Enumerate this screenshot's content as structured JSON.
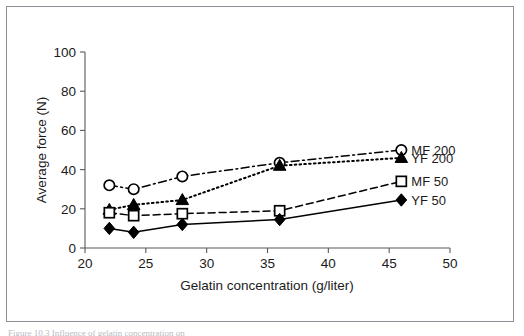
{
  "figure": {
    "caption_partial": "Figure 10.3  Influence of gelatin concentration on"
  },
  "chart_data": {
    "type": "line",
    "title": "",
    "xlabel": "Gelatin concentration (g/liter)",
    "ylabel": "Average force (N)",
    "xlim": [
      20,
      50
    ],
    "ylim": [
      0,
      100
    ],
    "xticks": [
      20,
      25,
      30,
      35,
      40,
      45,
      50
    ],
    "yticks": [
      0,
      20,
      40,
      60,
      80,
      100
    ],
    "xtick_labels": [
      "20",
      "25",
      "30",
      "35",
      "40",
      "45",
      "50"
    ],
    "ytick_labels": [
      "0",
      "20",
      "40",
      "60",
      "80",
      "100"
    ],
    "grid": false,
    "legend_position": "right-inline",
    "x": [
      22,
      24,
      28,
      36,
      46
    ],
    "series": [
      {
        "name": "MF 200",
        "values": [
          32,
          30,
          36.5,
          43.5,
          50
        ],
        "marker": "open-circle",
        "line_style": "dash-dot",
        "color": "#000000"
      },
      {
        "name": "YF 200",
        "values": [
          19.5,
          22,
          24.5,
          42,
          46
        ],
        "marker": "filled-triangle",
        "line_style": "dotted",
        "color": "#000000"
      },
      {
        "name": "MF 50",
        "values": [
          18,
          16.5,
          17.5,
          19,
          34
        ],
        "marker": "open-square",
        "line_style": "dashed",
        "color": "#000000"
      },
      {
        "name": "YF 50",
        "values": [
          10,
          8,
          12,
          14.5,
          24.5
        ],
        "marker": "filled-diamond",
        "line_style": "solid",
        "color": "#000000"
      }
    ]
  }
}
